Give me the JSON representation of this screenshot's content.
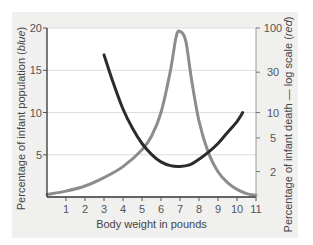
{
  "chart_data": {
    "type": "line",
    "title": "",
    "xlabel": "Body weight in pounds",
    "ylabel_left": "Percentage of infant population (blue)",
    "ylabel_left_parts": [
      "Percentage of infant population (",
      "blue",
      ")"
    ],
    "ylabel_right": "Percentage of infant death — log scale (red)",
    "ylabel_right_parts": [
      "Percentage of infant death — log scale (",
      "red",
      ")"
    ],
    "x_ticks": [
      "1",
      "2",
      "3",
      "4",
      "5",
      "6",
      "7",
      "8",
      "9",
      "10",
      "11"
    ],
    "xlim": [
      0,
      11
    ],
    "y_left_ticks": [
      "5",
      "10",
      "15",
      "20"
    ],
    "ylim_left": [
      0,
      20
    ],
    "y_right_ticks": [
      "2",
      "5",
      "10",
      "30",
      "100"
    ],
    "ylim_right": [
      1,
      100
    ],
    "y_right_scale": "log",
    "grid": "horizontal",
    "series": [
      {
        "name": "Infant population (blue)",
        "axis": "left",
        "color": "#8c8c8c",
        "x": [
          0,
          1,
          2,
          3,
          4,
          5,
          5.5,
          6,
          6.5,
          6.8,
          7,
          7.3,
          7.6,
          8,
          8.5,
          9,
          9.5,
          10,
          10.5,
          11
        ],
        "y": [
          0.3,
          0.7,
          1.3,
          2.3,
          3.6,
          5.6,
          7.2,
          10.0,
          15.0,
          19.0,
          19.6,
          18.5,
          14.0,
          9.0,
          5.2,
          3.0,
          1.7,
          0.9,
          0.4,
          0.2
        ]
      },
      {
        "name": "Infant death (red)",
        "axis": "right",
        "color": "#2b2b2b",
        "x": [
          3,
          3.5,
          4,
          4.5,
          5,
          5.5,
          6,
          6.5,
          7,
          7.5,
          8,
          8.5,
          9,
          9.5,
          10,
          10.3
        ],
        "y": [
          48,
          22,
          11,
          6.5,
          4.3,
          3.2,
          2.6,
          2.35,
          2.3,
          2.4,
          2.8,
          3.4,
          4.3,
          5.8,
          7.8,
          10
        ]
      }
    ]
  }
}
